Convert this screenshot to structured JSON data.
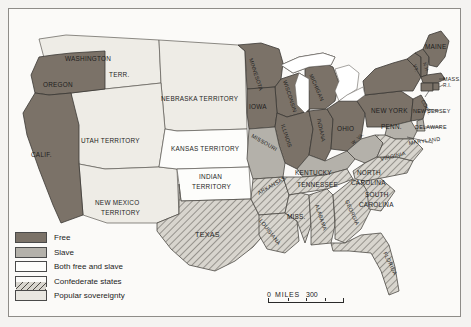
{
  "map": {
    "title": "The United States on the eve of the Civil War",
    "legend": {
      "items": [
        {
          "key": "free",
          "label": "Free",
          "color": "#7b7268"
        },
        {
          "key": "slave",
          "label": "Slave",
          "color": "#b4b1aa"
        },
        {
          "key": "both",
          "label": "Both free and slave",
          "color": "#fdfdfb"
        },
        {
          "key": "confederate",
          "label": "Confederate states",
          "color": "#d8d5ce"
        },
        {
          "key": "popular",
          "label": "Popular sovereignty",
          "color": "#e9e7e1"
        }
      ]
    },
    "scale": {
      "zero": "0",
      "unit": "MILES",
      "max": "300"
    },
    "labels": {
      "washington": "WASHINGTON",
      "washington_terr": "TERR.",
      "oregon": "OREGON",
      "california": "CALIF.",
      "utah": "UTAH TERRITORY",
      "new_mexico_1": "NEW MEXICO",
      "new_mexico_2": "TERRITORY",
      "nebraska": "NEBRASKA TERRITORY",
      "kansas": "KANSAS TERRITORY",
      "indian_1": "INDIAN",
      "indian_2": "TERRITORY",
      "texas": "TEXAS",
      "minnesota": "MINNESOTA",
      "wisconsin": "WISCONSIN",
      "iowa": "IOWA",
      "missouri": "MISSOURI",
      "illinois": "ILLINOIS",
      "indiana": "INDIANA",
      "michigan": "MICHIGAN",
      "ohio": "OHIO",
      "kentucky": "KENTUCKY",
      "west_virginia": "W. VA.",
      "virginia": "VIRGINIA",
      "north_carolina_1": "NORTH",
      "north_carolina_2": "CAROLINA",
      "south_carolina_1": "SOUTH",
      "south_carolina_2": "CAROLINA",
      "tennessee": "TENNESSEE",
      "arkansas": "ARKANSAS",
      "mississippi": "MISS.",
      "alabama": "ALABAMA",
      "georgia": "GEORGIA",
      "louisiana": "LOUISIANA",
      "florida": "FLORIDA",
      "maine": "MAINE",
      "vermont": "VT.",
      "new_hampshire": "N.H.",
      "massachusetts": "MASS.",
      "new_york": "NEW YORK",
      "pennsylvania": "PENN.",
      "connecticut": "CONN.",
      "rhode_island": "R.I.",
      "new_jersey": "NEW JERSEY",
      "delaware": "DELAWARE",
      "maryland": "MARYLAND"
    }
  }
}
